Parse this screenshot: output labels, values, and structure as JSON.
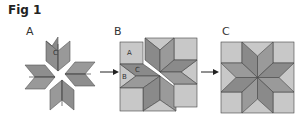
{
  "figure": {
    "title": "Fig 1",
    "panels": [
      {
        "id": "A",
        "label": "A",
        "description": "Eight diamond star points pieced into pairs; piece C marked"
      },
      {
        "id": "B",
        "label": "B",
        "description": "Star halves with background squares (A) and triangles (B) set in; pieces A, B, C marked"
      },
      {
        "id": "C",
        "label": "C",
        "description": "Completed eight-pointed star block"
      }
    ],
    "piece_labels": {
      "a": "A",
      "b": "B",
      "c": "C"
    },
    "arrows": [
      {
        "from": "A",
        "to": "B"
      },
      {
        "from": "B",
        "to": "C"
      }
    ],
    "colors": {
      "diamond_dark": "#8a8a8a",
      "diamond_mid": "#9a9a9a",
      "background_light": "#c8c8c8",
      "outline": "#3a3a3a",
      "text": "#333333"
    }
  }
}
